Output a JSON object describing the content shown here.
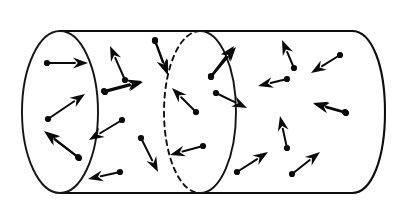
{
  "figure": {
    "type": "diagram",
    "background_color": "#ffffff",
    "ink_color": "#0a0a0a",
    "canvas": {
      "width": 402,
      "height": 216
    },
    "caption": "",
    "labels": [],
    "annotations": []
  },
  "cylinder": {
    "name": "cylinder-body",
    "top_edge": {
      "x1": 60,
      "y1": 31,
      "x2": 352,
      "y2": 31
    },
    "bottom_edge": {
      "x1": 60,
      "y1": 193,
      "x2": 352,
      "y2": 193
    },
    "left_cap": {
      "name": "left-end-ellipse",
      "cx": 60,
      "cy": 112,
      "rx": 38,
      "ry": 81,
      "style": "solid"
    },
    "right_cap": {
      "name": "right-end-cap",
      "cx": 352,
      "cy": 112,
      "rx": 33,
      "ry": 81,
      "style": "solid-front-half"
    },
    "cross_section": {
      "name": "middle-cross-section-ellipse",
      "cx": 200,
      "cy": 112,
      "rx": 36,
      "ry": 81,
      "front_half_style": "solid",
      "back_half_style": "dashed",
      "dash_pattern": "5 4.5"
    }
  },
  "vectors": {
    "count": 25,
    "style": {
      "tail_marker": "dot",
      "head_marker": "solid-triangle",
      "dot_radius": 3.1,
      "head_length": 15,
      "head_width": 11,
      "shaft_width": 2.0
    },
    "items": [
      {
        "id": "v01",
        "name": "vector-arrow-01",
        "region": "left-cap",
        "tail": [
          47,
          63
        ],
        "tip": [
          88,
          63
        ],
        "angle_deg": 0
      },
      {
        "id": "v02",
        "name": "vector-arrow-02",
        "region": "left-cap",
        "tail": [
          48,
          119
        ],
        "tip": [
          85,
          94
        ],
        "angle_deg": 34
      },
      {
        "id": "v03",
        "name": "vector-arrow-03",
        "region": "left-cap",
        "tail": [
          78,
          157
        ],
        "tip": [
          44,
          131
        ],
        "angle_deg": 143
      },
      {
        "id": "v04",
        "name": "vector-arrow-04",
        "region": "mid-left",
        "tail": [
          125,
          80
        ],
        "tip": [
          110,
          46
        ],
        "angle_deg": 66
      },
      {
        "id": "v05",
        "name": "vector-arrow-05",
        "region": "mid-left",
        "tail": [
          104,
          91
        ],
        "tip": [
          142,
          81
        ],
        "angle_deg": 15
      },
      {
        "id": "v06",
        "name": "vector-arrow-06",
        "region": "mid-left",
        "tail": [
          155,
          40
        ],
        "tip": [
          168,
          75
        ],
        "angle_deg": -70
      },
      {
        "id": "v07",
        "name": "vector-arrow-07",
        "region": "mid-left",
        "tail": [
          122,
          120
        ],
        "tip": [
          89,
          140
        ],
        "angle_deg": -149
      },
      {
        "id": "v08",
        "name": "vector-arrow-08",
        "region": "mid-left",
        "tail": [
          141,
          138
        ],
        "tip": [
          158,
          172
        ],
        "angle_deg": -63
      },
      {
        "id": "v09",
        "name": "vector-arrow-09",
        "region": "mid-left",
        "tail": [
          120,
          172
        ],
        "tip": [
          88,
          179
        ],
        "angle_deg": -168
      },
      {
        "id": "v10",
        "name": "vector-arrow-10",
        "region": "cross-section",
        "tail": [
          196,
          112
        ],
        "tip": [
          172,
          88
        ],
        "angle_deg": 135
      },
      {
        "id": "v11",
        "name": "vector-arrow-11",
        "region": "cross-section",
        "tail": [
          203,
          146
        ],
        "tip": [
          170,
          155
        ],
        "angle_deg": -165
      },
      {
        "id": "v12",
        "name": "vector-arrow-12",
        "region": "cross-section",
        "tail": [
          211,
          76
        ],
        "tip": [
          234,
          46
        ],
        "angle_deg": 52
      },
      {
        "id": "v13",
        "name": "vector-arrow-13",
        "region": "cross-section",
        "tail": [
          216,
          93
        ],
        "tip": [
          247,
          108
        ],
        "angle_deg": -26
      },
      {
        "id": "v14",
        "name": "vector-arrow-14",
        "region": "right-body",
        "tail": [
          294,
          68
        ],
        "tip": [
          282,
          40
        ],
        "angle_deg": 67
      },
      {
        "id": "v15",
        "name": "vector-arrow-15",
        "region": "right-body",
        "tail": [
          340,
          55
        ],
        "tip": [
          311,
          73
        ],
        "angle_deg": -148
      },
      {
        "id": "v16",
        "name": "vector-arrow-16",
        "region": "right-body",
        "tail": [
          287,
          79
        ],
        "tip": [
          258,
          86
        ],
        "angle_deg": -166
      },
      {
        "id": "v17",
        "name": "vector-arrow-17",
        "region": "right-body",
        "tail": [
          345,
          112
        ],
        "tip": [
          313,
          103
        ],
        "angle_deg": 164
      },
      {
        "id": "v18",
        "name": "vector-arrow-18",
        "region": "right-body",
        "tail": [
          287,
          148
        ],
        "tip": [
          280,
          116
        ],
        "angle_deg": 78
      },
      {
        "id": "v19",
        "name": "vector-arrow-19",
        "region": "right-body",
        "tail": [
          237,
          172
        ],
        "tip": [
          268,
          152
        ],
        "angle_deg": 33
      },
      {
        "id": "v20",
        "name": "vector-arrow-20",
        "region": "right-body",
        "tail": [
          292,
          174
        ],
        "tip": [
          320,
          152
        ],
        "angle_deg": 38
      },
      {
        "id": "v21",
        "name": "vector-arrow-21",
        "region": "mid-left",
        "tail": [
          155,
          41
        ],
        "tip": [
          167,
          74
        ],
        "angle_deg": -70
      },
      {
        "id": "v22",
        "name": "vector-arrow-22",
        "region": "cross-section-right",
        "tail": [
          211,
          77
        ],
        "tip": [
          236,
          47
        ],
        "angle_deg": 50
      },
      {
        "id": "v23",
        "name": "vector-arrow-23",
        "region": "right-body",
        "tail": [
          346,
          113
        ],
        "tip": [
          314,
          104
        ],
        "angle_deg": 164
      },
      {
        "id": "v24",
        "name": "vector-arrow-24",
        "region": "mid-left",
        "tail": [
          105,
          92
        ],
        "tip": [
          143,
          82
        ],
        "angle_deg": 15
      },
      {
        "id": "v25",
        "name": "vector-arrow-25",
        "region": "left-cap",
        "tail": [
          79,
          158
        ],
        "tip": [
          45,
          132
        ],
        "angle_deg": 143
      }
    ]
  }
}
